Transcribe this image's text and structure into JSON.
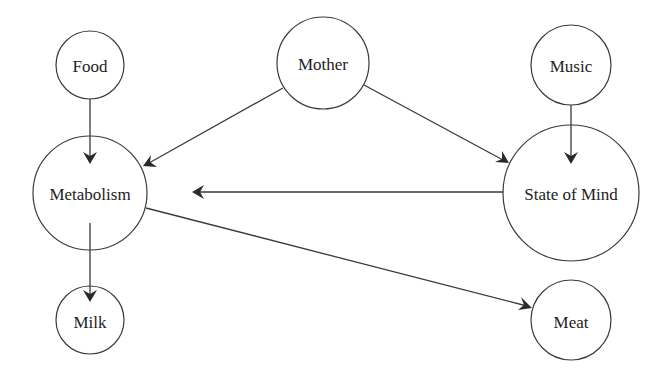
{
  "diagram": {
    "type": "directed-graph",
    "nodes": [
      {
        "id": "food",
        "label": "Food",
        "cx": 90,
        "cy": 65,
        "r": 34
      },
      {
        "id": "mother",
        "label": "Mother",
        "cx": 323,
        "cy": 63,
        "r": 46
      },
      {
        "id": "music",
        "label": "Music",
        "cx": 571,
        "cy": 65,
        "r": 40
      },
      {
        "id": "metabolism",
        "label": "Metabolism",
        "cx": 90,
        "cy": 193,
        "r": 57
      },
      {
        "id": "state_of_mind",
        "label": "State of Mind",
        "cx": 571,
        "cy": 193,
        "r": 68
      },
      {
        "id": "milk",
        "label": "Milk",
        "cx": 90,
        "cy": 320,
        "r": 34
      },
      {
        "id": "meat",
        "label": "Meat",
        "cx": 571,
        "cy": 320,
        "r": 40
      }
    ],
    "edges": [
      {
        "from": "food",
        "to": "metabolism"
      },
      {
        "from": "mother",
        "to": "metabolism"
      },
      {
        "from": "mother",
        "to": "state_of_mind"
      },
      {
        "from": "music",
        "to": "state_of_mind"
      },
      {
        "from": "state_of_mind",
        "to": "metabolism"
      },
      {
        "from": "metabolism",
        "to": "milk"
      },
      {
        "from": "metabolism",
        "to": "meat"
      }
    ],
    "colors": {
      "stroke": "#3a3a3a",
      "text": "#222222",
      "background": "#ffffff"
    }
  },
  "labels": {
    "food": "Food",
    "mother": "Mother",
    "music": "Music",
    "metabolism": "Metabolism",
    "state_of_mind": "State of Mind",
    "milk": "Milk",
    "meat": "Meat"
  }
}
